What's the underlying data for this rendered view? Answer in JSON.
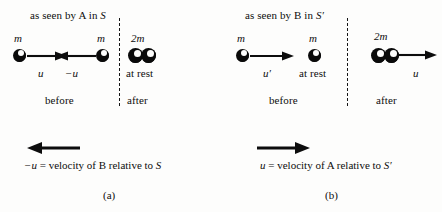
{
  "figure": {
    "background_color": "#fdfdfc",
    "ink_color": "#0d0d0d",
    "width": 442,
    "height": 212
  },
  "panel_a": {
    "subfigure_label": "(a)",
    "header": {
      "prefix": "as seen by A in ",
      "frame": "S"
    },
    "before": {
      "section_label": "before",
      "left_ball": {
        "mass_label": "m",
        "velocity_label": "u",
        "direction": "right"
      },
      "right_ball": {
        "mass_label": "m",
        "velocity_label": "−u",
        "direction": "left"
      }
    },
    "after": {
      "section_label": "after",
      "combined": {
        "mass_label": "2m",
        "state_label": "at rest",
        "direction": "none"
      }
    },
    "frame_velocity": {
      "arrow_direction": "left",
      "caption_velocity": "−u",
      "caption_equals": " = velocity of B relative to ",
      "caption_frame": "S"
    }
  },
  "panel_b": {
    "subfigure_label": "(b)",
    "header": {
      "prefix": "as seen by B in ",
      "frame": "S′"
    },
    "before": {
      "section_label": "before",
      "left_ball": {
        "mass_label": "m",
        "velocity_label": "u′",
        "direction": "right"
      },
      "right_ball": {
        "mass_label": "m",
        "state_label": "at rest",
        "direction": "none"
      }
    },
    "after": {
      "section_label": "after",
      "combined": {
        "mass_label": "2m",
        "velocity_label": "u",
        "direction": "right"
      }
    },
    "frame_velocity": {
      "arrow_direction": "right",
      "caption_velocity": "u",
      "caption_equals": " = velocity of A relative to ",
      "caption_frame": "S′"
    }
  }
}
